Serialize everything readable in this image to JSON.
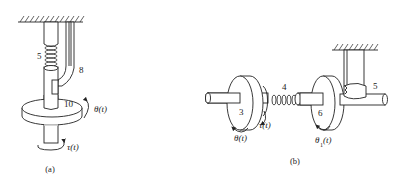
{
  "figure": {
    "panels": [
      {
        "id": "a",
        "caption": "(a)",
        "labels": {
          "spring": "5",
          "bar": "8",
          "disk": "10",
          "theta": "θ(t)",
          "torque": "τ(t)"
        }
      },
      {
        "id": "b",
        "caption": "(b)",
        "labels": {
          "disk_left": "3",
          "spring": "4",
          "disk_right": "6",
          "damper": "5",
          "theta": "θ(t)",
          "torque": "τ(t)",
          "theta1": "θ",
          "theta1_sub": "1",
          "theta1_arg": "(t)"
        }
      }
    ]
  }
}
